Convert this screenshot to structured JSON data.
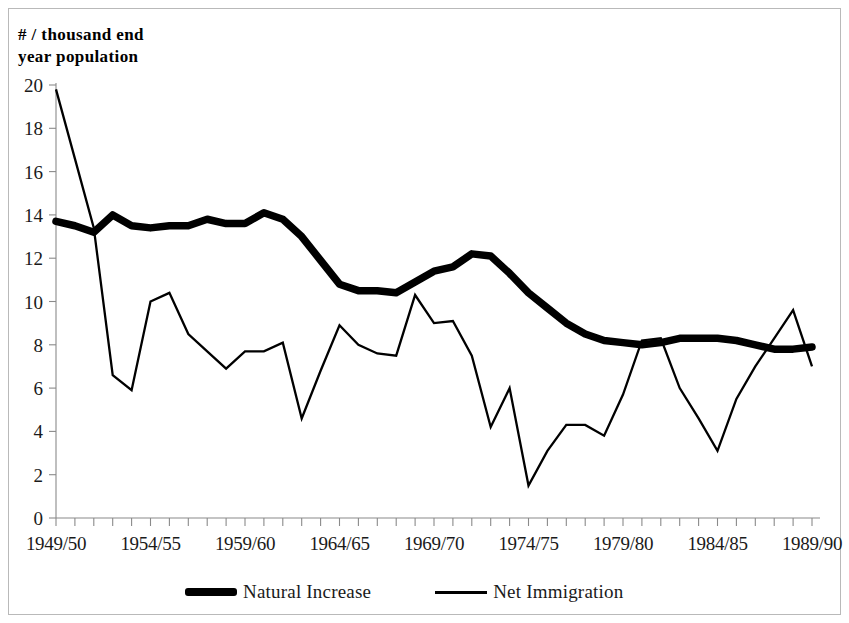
{
  "chart_data": {
    "type": "line",
    "title": "",
    "ylabel": "# / thousand end\n year population",
    "xlabel": "",
    "ylim": [
      0,
      20
    ],
    "ytick_labels": [
      "0",
      "2",
      "4",
      "6",
      "8",
      "10",
      "12",
      "14",
      "16",
      "18",
      "20"
    ],
    "ytick_values": [
      0,
      2,
      4,
      6,
      8,
      10,
      12,
      14,
      16,
      18,
      20
    ],
    "grid": false,
    "legend_position": "bottom",
    "x": [
      "1949/50",
      "1950/51",
      "1951/52",
      "1952/53",
      "1953/54",
      "1954/55",
      "1955/56",
      "1956/57",
      "1957/58",
      "1958/59",
      "1959/60",
      "1960/61",
      "1961/62",
      "1962/63",
      "1963/64",
      "1964/65",
      "1965/66",
      "1966/67",
      "1967/68",
      "1968/69",
      "1969/70",
      "1970/71",
      "1971/72",
      "1972/73",
      "1973/74",
      "1974/75",
      "1975/76",
      "1976/77",
      "1977/78",
      "1978/79",
      "1979/80",
      "1980/81",
      "1981/82",
      "1982/83",
      "1983/84",
      "1984/85",
      "1985/86",
      "1986/87",
      "1987/88",
      "1988/89",
      "1989/90"
    ],
    "xtick_labels": [
      "1949/50",
      "1954/55",
      "1959/60",
      "1964/65",
      "1969/70",
      "1974/75",
      "1979/80",
      "1984/85",
      "1989/90"
    ],
    "xtick_indices": [
      0,
      5,
      10,
      15,
      20,
      25,
      30,
      35,
      40
    ],
    "series": [
      {
        "name": "Natural Increase",
        "style": "thick",
        "values": [
          13.7,
          13.5,
          13.2,
          14.0,
          13.5,
          13.4,
          13.5,
          13.5,
          13.8,
          13.6,
          13.6,
          14.1,
          13.8,
          13.0,
          11.9,
          10.8,
          10.5,
          10.5,
          10.4,
          10.9,
          11.4,
          11.6,
          12.2,
          12.1,
          11.3,
          10.4,
          9.7,
          9.0,
          8.5,
          8.2,
          8.1,
          8.0,
          8.1,
          8.3,
          8.3,
          8.3,
          8.2,
          8.0,
          7.8,
          7.8,
          7.9
        ]
      },
      {
        "name": "Net Immigration",
        "style": "thin",
        "values": [
          19.8,
          16.6,
          13.4,
          6.6,
          5.9,
          10.0,
          10.4,
          8.5,
          7.7,
          6.9,
          7.7,
          7.7,
          8.1,
          4.6,
          6.8,
          8.9,
          8.0,
          7.6,
          7.5,
          10.3,
          9.0,
          9.1,
          7.5,
          4.2,
          6.0,
          1.5,
          3.1,
          4.3,
          4.3,
          3.8,
          5.7,
          8.2,
          8.3,
          6.0,
          4.6,
          3.1,
          5.5,
          7.0,
          8.3,
          9.6,
          7.0
        ]
      }
    ]
  },
  "legend": {
    "entries": [
      {
        "label": "Natural Increase"
      },
      {
        "label": "Net Immigration"
      }
    ]
  }
}
